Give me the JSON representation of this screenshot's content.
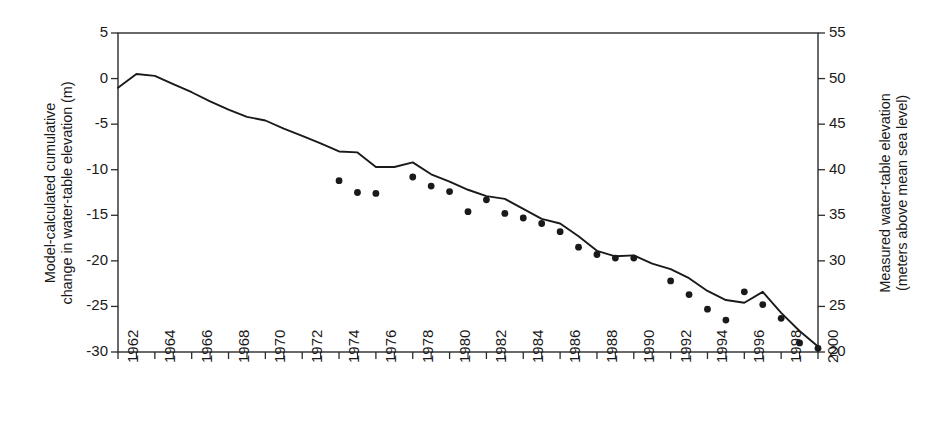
{
  "chart_data": {
    "type": "line",
    "title": "",
    "xlabel": "",
    "ylabel": "Model-calculated cumulative\nchange in water-table elevation (m)",
    "y2label": "Measured water-table elevation\n(meters above mean sea level)",
    "xlim": [
      1962,
      2000
    ],
    "ylim": [
      -30,
      5
    ],
    "y2lim": [
      20,
      55
    ],
    "grid": false,
    "legend": "none",
    "y_ticks": [
      5,
      0,
      -5,
      -10,
      -15,
      -20,
      -25,
      -30
    ],
    "y_tick_labels": [
      "5",
      "0",
      "-5",
      "-10",
      "-15",
      "-20",
      "-25",
      "-30"
    ],
    "y2_ticks": [
      55,
      50,
      45,
      40,
      35,
      30,
      25,
      20
    ],
    "y2_tick_labels": [
      "55",
      "50",
      "45",
      "40",
      "35",
      "30",
      "25",
      "20"
    ],
    "x_ticks": [
      1962,
      1964,
      1966,
      1968,
      1970,
      1972,
      1974,
      1976,
      1978,
      1980,
      1982,
      1984,
      1986,
      1988,
      1990,
      1992,
      1994,
      1996,
      1998,
      2000
    ],
    "x_tick_labels": [
      "1962",
      "1964",
      "1966",
      "1968",
      "1970",
      "1972",
      "1974",
      "1976",
      "1978",
      "1980",
      "1982",
      "1984",
      "1986",
      "1988",
      "1990",
      "1992",
      "1994",
      "1996",
      "1998",
      "2000"
    ],
    "x_minor_ticks": [
      1963,
      1965,
      1967,
      1969,
      1971,
      1973,
      1975,
      1977,
      1979,
      1981,
      1983,
      1985,
      1987,
      1989,
      1991,
      1993,
      1995,
      1997,
      1999
    ],
    "series": [
      {
        "name": "Model-calculated cumulative change in water-table elevation",
        "type": "line",
        "color": "#1a1a1a",
        "x": [
          1962,
          1963,
          1964,
          1965,
          1966,
          1967,
          1968,
          1969,
          1970,
          1971,
          1972,
          1973,
          1974,
          1975,
          1976,
          1977,
          1978,
          1979,
          1980,
          1981,
          1982,
          1983,
          1984,
          1985,
          1986,
          1987,
          1988,
          1989,
          1990,
          1991,
          1992,
          1993,
          1994,
          1995,
          1996,
          1997,
          1998,
          1999,
          2000
        ],
        "values": [
          -1.0,
          0.5,
          0.3,
          -0.6,
          -1.5,
          -2.5,
          -3.4,
          -4.2,
          -4.6,
          -5.5,
          -6.3,
          -7.1,
          -8.0,
          -8.1,
          -9.7,
          -9.7,
          -9.2,
          -10.5,
          -11.3,
          -12.2,
          -12.9,
          -13.2,
          -14.3,
          -15.4,
          -15.9,
          -17.3,
          -18.9,
          -19.5,
          -19.4,
          -20.3,
          -20.9,
          -21.9,
          -23.3,
          -24.3,
          -24.6,
          -23.4,
          -25.7,
          -27.7,
          -29.4
        ]
      },
      {
        "name": "Measured water-table elevation",
        "type": "scatter",
        "color": "#1a1a1a",
        "x": [
          1974,
          1975,
          1976,
          1978,
          1979,
          1980,
          1981,
          1982,
          1983,
          1984,
          1985,
          1986,
          1987,
          1988,
          1989,
          1990,
          1992,
          1993,
          1994,
          1995,
          1996,
          1997,
          1998,
          1999,
          2000
        ],
        "values": [
          -11.2,
          -12.5,
          -12.6,
          -10.8,
          -11.8,
          -12.4,
          -14.6,
          -13.3,
          -14.8,
          -15.3,
          -15.9,
          -16.8,
          -18.5,
          -19.3,
          -19.7,
          -19.7,
          -22.2,
          -23.7,
          -25.3,
          -26.5,
          -23.4,
          -24.8,
          -26.3,
          -29.0,
          -29.6
        ]
      }
    ]
  }
}
